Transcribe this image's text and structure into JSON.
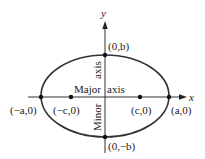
{
  "diagram": {
    "type": "ellipse",
    "axes": {
      "x_label": "x",
      "y_label": "y"
    },
    "points": [
      {
        "id": "vertex-left",
        "label": "(−a,0)"
      },
      {
        "id": "focus-left",
        "label": "(−c,0)"
      },
      {
        "id": "focus-right",
        "label": "(c,0)"
      },
      {
        "id": "vertex-right",
        "label": "(a,0)"
      },
      {
        "id": "co-vertex-top",
        "label": "(0,b)"
      },
      {
        "id": "co-vertex-bottom",
        "label": "(0,−b)"
      }
    ],
    "annotations": {
      "major_word": "Major",
      "major_axis_word": "axis",
      "minor_word": "Minor",
      "minor_axis_word": "axis"
    },
    "colors": {
      "stroke": "#333333",
      "text": "#222222"
    }
  }
}
